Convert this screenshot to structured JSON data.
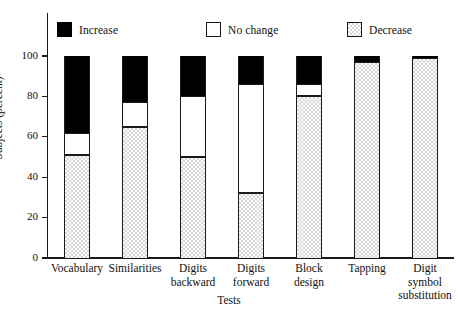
{
  "chart_data": {
    "type": "bar",
    "stacked": true,
    "title": "",
    "xlabel": "Tests",
    "ylabel": "Subjects (percent)",
    "ylim": [
      0,
      100
    ],
    "yticks": [
      0,
      20,
      40,
      60,
      80,
      100
    ],
    "ytick_labels": [
      "0",
      "20",
      "40",
      "60",
      "80",
      "100"
    ],
    "grid": false,
    "legend_position": "top",
    "categories": [
      "Vocabulary",
      "Similarities",
      "Digits backward",
      "Digits forward",
      "Block design",
      "Tapping",
      "Digit symbol substitution"
    ],
    "category_lines": [
      [
        "Vocabulary"
      ],
      [
        "Similarities"
      ],
      [
        "Digits",
        "backward"
      ],
      [
        "Digits",
        "forward"
      ],
      [
        "Block",
        "design"
      ],
      [
        "Tapping"
      ],
      [
        "Digit symbol",
        "substitution"
      ]
    ],
    "series": [
      {
        "name": "Decrease",
        "color": "#d9d9d9",
        "values": [
          51,
          65,
          50,
          32,
          80,
          97,
          99
        ]
      },
      {
        "name": "No change",
        "color": "#ffffff",
        "values": [
          11,
          12,
          30,
          54,
          6,
          0,
          0
        ]
      },
      {
        "name": "Increase",
        "color": "#000000",
        "values": [
          38,
          23,
          20,
          14,
          14,
          3,
          1
        ]
      }
    ],
    "cumulative_tops": {
      "decrease": [
        51,
        65,
        50,
        32,
        80,
        97,
        99
      ],
      "no_change": [
        62,
        77,
        80,
        86,
        86,
        97,
        99
      ],
      "increase": [
        100,
        100,
        100,
        100,
        100,
        100,
        100
      ]
    }
  },
  "legend": {
    "items": [
      {
        "label": "Increase",
        "swatch": "increase-swatch"
      },
      {
        "label": "No change",
        "swatch": "no-change-swatch"
      },
      {
        "label": "Decrease",
        "swatch": "decrease-swatch"
      }
    ]
  },
  "colors": {
    "increase": "#000000",
    "no_change": "#ffffff",
    "decrease": "#d9d9d9",
    "axis": "#1a1a1a",
    "background": "#ffffff"
  }
}
